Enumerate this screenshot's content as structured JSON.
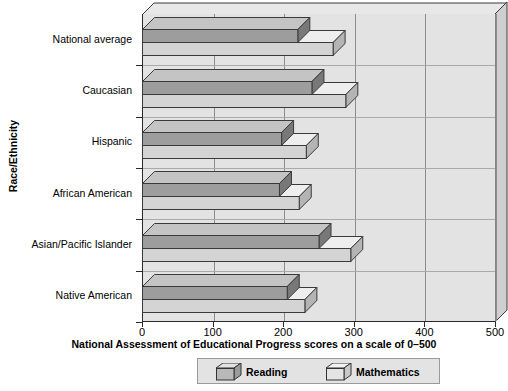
{
  "chart_data": {
    "type": "bar",
    "orientation": "horizontal",
    "title": "",
    "xlabel": "National Assessment of Educational Progress scores on a scale of 0–500",
    "ylabel": "Race/Ethnicity",
    "xlim": [
      0,
      500
    ],
    "xticks": [
      0,
      100,
      200,
      300,
      400,
      500
    ],
    "xticklabels": [
      "0",
      "100",
      "200",
      "300",
      "400",
      "500"
    ],
    "grid": "vertical",
    "legend_position": "bottom",
    "categories": [
      "National average",
      "Caucasian",
      "Hispanic",
      "African American",
      "Asian/Pacific Islander",
      "Native American"
    ],
    "series": [
      {
        "name": "Reading",
        "color": "#9d9d9d",
        "values": [
          220,
          240,
          197,
          194,
          250,
          205
        ]
      },
      {
        "name": "Mathematics",
        "color": "#d2d2d2",
        "values": [
          270,
          288,
          232,
          222,
          295,
          230
        ]
      }
    ]
  },
  "legend": {
    "reading_label": "Reading",
    "mathematics_label": "Mathematics"
  }
}
